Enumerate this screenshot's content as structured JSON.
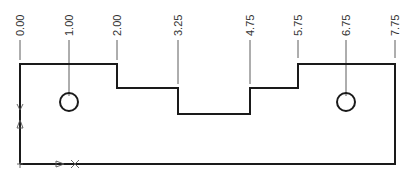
{
  "drawing": {
    "type": "ordinate-dimensioned part outline",
    "colors": {
      "outline": "#1a1a1a",
      "dimension": "#333333"
    },
    "ordinate_labels": [
      "0.00",
      "1.00",
      "2.00",
      "3.25",
      "4.75",
      "5.75",
      "6.75",
      "7.75"
    ],
    "ordinate_features": [
      {
        "label": "0.00",
        "feature": "left edge"
      },
      {
        "label": "1.00",
        "feature": "left hole center"
      },
      {
        "label": "2.00",
        "feature": "first step"
      },
      {
        "label": "3.25",
        "feature": "notch start"
      },
      {
        "label": "4.75",
        "feature": "notch end"
      },
      {
        "label": "5.75",
        "feature": "second step"
      },
      {
        "label": "6.75",
        "feature": "right hole center"
      },
      {
        "label": "7.75",
        "feature": "right edge"
      }
    ],
    "holes": 2,
    "datum_origin_marker": "bottom-left"
  }
}
